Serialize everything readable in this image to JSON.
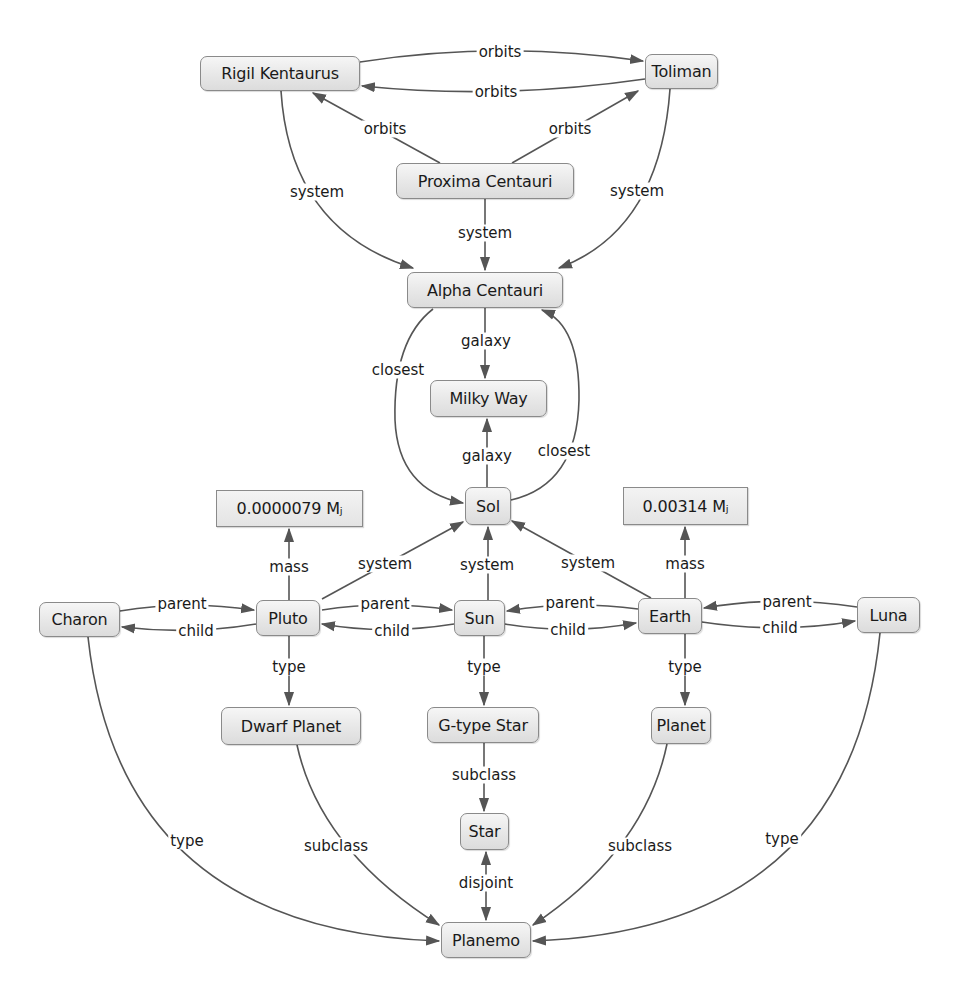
{
  "diagram": {
    "title": "",
    "colors": {
      "edge": "#555555",
      "node_border": "#8a8a8a",
      "node_fill": "#e7e7e7",
      "text": "#1a1a1a"
    },
    "nodes": [
      {
        "id": "rigil",
        "label": "Rigil Kentaurus",
        "x": 200,
        "y": 56,
        "w": 160,
        "h": 35
      },
      {
        "id": "toliman",
        "label": "Toliman",
        "x": 645,
        "y": 54,
        "w": 73,
        "h": 35
      },
      {
        "id": "proxima",
        "label": "Proxima Centauri",
        "x": 396,
        "y": 163,
        "w": 178,
        "h": 36
      },
      {
        "id": "alpha",
        "label": "Alpha Centauri",
        "x": 407,
        "y": 272,
        "w": 156,
        "h": 36
      },
      {
        "id": "milkyway",
        "label": "Milky Way",
        "x": 430,
        "y": 380,
        "w": 117,
        "h": 37
      },
      {
        "id": "sol",
        "label": "Sol",
        "x": 465,
        "y": 487,
        "w": 46,
        "h": 38
      },
      {
        "id": "mass_pluto",
        "label": "0.0000079 Mⱼ",
        "x": 216,
        "y": 490,
        "w": 147,
        "h": 37,
        "literal": true
      },
      {
        "id": "mass_earth",
        "label": "0.00314 Mⱼ",
        "x": 623,
        "y": 487,
        "w": 125,
        "h": 38,
        "literal": true
      },
      {
        "id": "charon",
        "label": "Charon",
        "x": 39,
        "y": 602,
        "w": 81,
        "h": 35
      },
      {
        "id": "pluto",
        "label": "Pluto",
        "x": 256,
        "y": 600,
        "w": 64,
        "h": 36
      },
      {
        "id": "sun",
        "label": "Sun",
        "x": 454,
        "y": 600,
        "w": 51,
        "h": 36
      },
      {
        "id": "earth",
        "label": "Earth",
        "x": 638,
        "y": 598,
        "w": 64,
        "h": 36
      },
      {
        "id": "luna",
        "label": "Luna",
        "x": 857,
        "y": 597,
        "w": 63,
        "h": 36
      },
      {
        "id": "dwarf",
        "label": "Dwarf Planet",
        "x": 221,
        "y": 707,
        "w": 140,
        "h": 38
      },
      {
        "id": "gtype",
        "label": "G-type Star",
        "x": 427,
        "y": 707,
        "w": 112,
        "h": 36
      },
      {
        "id": "planet",
        "label": "Planet",
        "x": 651,
        "y": 707,
        "w": 60,
        "h": 37
      },
      {
        "id": "star",
        "label": "Star",
        "x": 460,
        "y": 813,
        "w": 49,
        "h": 37
      },
      {
        "id": "planemo",
        "label": "Planemo",
        "x": 441,
        "y": 922,
        "w": 90,
        "h": 36
      }
    ],
    "edges": [
      {
        "from": "rigil",
        "to": "toliman",
        "label": "orbits",
        "path": "M360,62 Q500,40 643,61",
        "lx": 500,
        "ly": 52,
        "arrow_end": true
      },
      {
        "from": "toliman",
        "to": "rigil",
        "label": "orbits",
        "path": "M645,79 Q500,100 362,86",
        "lx": 496,
        "ly": 92,
        "arrow_end": true
      },
      {
        "from": "proxima",
        "to": "rigil",
        "label": "orbits",
        "path": "M440,163 L313,93",
        "lx": 385,
        "ly": 129,
        "arrow_end": true
      },
      {
        "from": "proxima",
        "to": "toliman",
        "label": "orbits",
        "path": "M512,163 L638,91",
        "lx": 570,
        "ly": 129,
        "arrow_end": true
      },
      {
        "from": "rigil",
        "to": "alpha",
        "label": "system",
        "path": "M281,91 Q290,230 413,268",
        "lx": 317,
        "ly": 192,
        "arrow_end": true
      },
      {
        "from": "toliman",
        "to": "alpha",
        "label": "system",
        "path": "M670,89 Q660,230 559,268",
        "lx": 637,
        "ly": 191,
        "arrow_end": true
      },
      {
        "from": "proxima",
        "to": "alpha",
        "label": "system",
        "path": "M485,199 L485,270",
        "lx": 485,
        "ly": 233,
        "arrow_end": true
      },
      {
        "from": "alpha",
        "to": "milkyway",
        "label": "galaxy",
        "path": "M485,308 L485,378",
        "lx": 486,
        "ly": 341,
        "arrow_end": true
      },
      {
        "from": "sol",
        "to": "milkyway",
        "label": "galaxy",
        "path": "M487,487 L487,419",
        "lx": 487,
        "ly": 456,
        "arrow_end": true
      },
      {
        "from": "alpha",
        "to": "sol",
        "label": "closest",
        "path": "M433,309 Q393,340 395,420 Q398,490 463,503",
        "lx": 398,
        "ly": 370,
        "arrow_end": true
      },
      {
        "from": "sol",
        "to": "alpha",
        "label": "closest",
        "path": "M511,500 Q577,485 579,400 Q580,325 542,310",
        "lx": 564,
        "ly": 451,
        "arrow_end": true
      },
      {
        "from": "pluto",
        "to": "mass_pluto",
        "label": "mass",
        "path": "M289,600 L289,529",
        "lx": 289,
        "ly": 567,
        "arrow_end": true
      },
      {
        "from": "earth",
        "to": "mass_earth",
        "label": "mass",
        "path": "M685,598 L685,527",
        "lx": 685,
        "ly": 564,
        "arrow_end": true
      },
      {
        "from": "pluto",
        "to": "sol",
        "label": "system",
        "path": "M322,599 L463,522",
        "lx": 385,
        "ly": 564,
        "arrow_end": true
      },
      {
        "from": "sun",
        "to": "sol",
        "label": "system",
        "path": "M488,600 L488,527",
        "lx": 487,
        "ly": 565,
        "arrow_end": true
      },
      {
        "from": "earth",
        "to": "sol",
        "label": "system",
        "path": "M651,598 L512,521",
        "lx": 588,
        "ly": 563,
        "arrow_end": true
      },
      {
        "from": "charon",
        "to": "pluto",
        "label": "parent",
        "path": "M120,611 Q185,600 254,610",
        "lx": 182,
        "ly": 604,
        "arrow_end": true
      },
      {
        "from": "pluto",
        "to": "charon",
        "label": "child",
        "path": "M256,624 Q190,635 122,627",
        "lx": 196,
        "ly": 631,
        "arrow_end": true
      },
      {
        "from": "pluto",
        "to": "sun",
        "label": "parent",
        "path": "M322,610 Q385,600 452,610",
        "lx": 385,
        "ly": 604,
        "arrow_end": true
      },
      {
        "from": "sun",
        "to": "pluto",
        "label": "child",
        "path": "M454,624 Q385,635 322,624",
        "lx": 392,
        "ly": 631,
        "arrow_end": true
      },
      {
        "from": "earth",
        "to": "sun",
        "label": "parent",
        "path": "M638,609 Q570,600 507,611",
        "lx": 570,
        "ly": 603,
        "arrow_end": true
      },
      {
        "from": "sun",
        "to": "earth",
        "label": "child",
        "path": "M505,624 Q570,635 636,623",
        "lx": 568,
        "ly": 630,
        "arrow_end": true
      },
      {
        "from": "luna",
        "to": "earth",
        "label": "parent",
        "path": "M857,607 Q780,595 704,608",
        "lx": 787,
        "ly": 602,
        "arrow_end": true
      },
      {
        "from": "earth",
        "to": "luna",
        "label": "child",
        "path": "M702,622 Q780,634 855,621",
        "lx": 780,
        "ly": 628,
        "arrow_end": true
      },
      {
        "from": "pluto",
        "to": "dwarf",
        "label": "type",
        "path": "M289,636 L289,705",
        "lx": 289,
        "ly": 667,
        "arrow_end": true
      },
      {
        "from": "sun",
        "to": "gtype",
        "label": "type",
        "path": "M484,636 L484,705",
        "lx": 484,
        "ly": 667,
        "arrow_end": true
      },
      {
        "from": "earth",
        "to": "planet",
        "label": "type",
        "path": "M685,634 L685,705",
        "lx": 685,
        "ly": 667,
        "arrow_end": true
      },
      {
        "from": "gtype",
        "to": "star",
        "label": "subclass",
        "path": "M484,743 L484,811",
        "lx": 484,
        "ly": 775,
        "arrow_end": true
      },
      {
        "from": "star",
        "to": "planemo",
        "label": "disjoint",
        "path": "M486,852 L486,920",
        "lx": 486,
        "ly": 883,
        "arrow_start": true,
        "arrow_end": true
      },
      {
        "from": "dwarf",
        "to": "planemo",
        "label": "subclass",
        "path": "M297,745 Q320,850 439,925",
        "lx": 336,
        "ly": 846,
        "arrow_end": true
      },
      {
        "from": "planet",
        "to": "planemo",
        "label": "subclass",
        "path": "M667,744 Q645,850 533,925",
        "lx": 640,
        "ly": 846,
        "arrow_end": true
      },
      {
        "from": "charon",
        "to": "planemo",
        "label": "type",
        "path": "M88,637 Q120,930 439,941",
        "lx": 187,
        "ly": 841,
        "arrow_end": true
      },
      {
        "from": "luna",
        "to": "planemo",
        "label": "type",
        "path": "M880,633 Q850,930 533,941",
        "lx": 782,
        "ly": 839,
        "arrow_end": true
      }
    ]
  }
}
